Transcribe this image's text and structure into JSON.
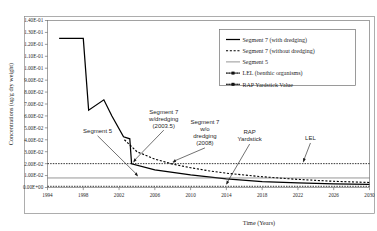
{
  "chart_data": {
    "type": "line",
    "title": "",
    "xlabel": "Time (Years)",
    "ylabel": "Concentrations (ug/g dry weight)",
    "xlim": [
      1994,
      2030
    ],
    "ylim": [
      0.0,
      0.14
    ],
    "xticks": [
      "1994",
      "1998",
      "2002",
      "2006",
      "2010",
      "2014",
      "2018",
      "2022",
      "2026",
      "2030"
    ],
    "yticks": [
      "0.00E+00",
      "1.00E-02",
      "2.00E-02",
      "3.00E-02",
      "4.00E-02",
      "5.00E-02",
      "6.00E-02",
      "7.00E-02",
      "8.00E-02",
      "9.00E-02",
      "1.00E-01",
      "1.10E-01",
      "1.20E-01",
      "1.30E-01",
      "1.40E-01"
    ],
    "grid": false,
    "legend_position": "top-right",
    "series": [
      {
        "name": "Segment 7 (with dredging)",
        "style": "solid",
        "x": [
          1995.3,
          1998.0,
          1998.6,
          2000.3,
          2001.2,
          2002.5,
          2003.2,
          2003.4,
          2006.0,
          2010.0,
          2014.0,
          2018.0,
          2022.0,
          2026.0,
          2030.0
        ],
        "y": [
          0.125,
          0.125,
          0.0648,
          0.0735,
          0.06,
          0.0425,
          0.0408,
          0.0198,
          0.0148,
          0.0105,
          0.0072,
          0.005,
          0.0038,
          0.003,
          0.0026
        ]
      },
      {
        "name": "Segment 7 (without dredging)",
        "style": "dashed",
        "x": [
          2002.6,
          2004.0,
          2006.0,
          2008.0,
          2010.0,
          2012.0,
          2014.0,
          2018.0,
          2022.0,
          2026.0,
          2030.0
        ],
        "y": [
          0.04,
          0.03,
          0.0238,
          0.0196,
          0.0166,
          0.014,
          0.012,
          0.009,
          0.0068,
          0.0052,
          0.0042
        ]
      },
      {
        "name": "Segment 5",
        "style": "thin-solid",
        "x": [
          1994,
          2030
        ],
        "y": [
          0.008,
          0.008
        ]
      },
      {
        "name": "LEL (benthic organisms)",
        "style": "dotted",
        "x": [
          1994,
          2030
        ],
        "y": [
          0.02,
          0.02
        ]
      },
      {
        "name": "RAP Yardstick Value",
        "style": "dotted",
        "x": [
          1994,
          2030
        ],
        "y": [
          0.001,
          0.001
        ]
      }
    ],
    "annotations": [
      {
        "name": "segment-5",
        "lines": [
          "Segment 5"
        ],
        "x": 1999.6,
        "y": 0.0455,
        "arrow_to_x": 2004.1,
        "arrow_to_y": 0.0082
      },
      {
        "name": "segment-7-with-dredging",
        "lines": [
          "Segment 7",
          "w/dredging",
          "(2003.5)"
        ],
        "x": 2007.0,
        "y": 0.062,
        "arrow_to_x": 2003.6,
        "arrow_to_y": 0.02
      },
      {
        "name": "segment-7-without-dredging",
        "lines": [
          "Segment 7",
          "w/o",
          "dredging",
          "(2008)"
        ],
        "x": 2011.6,
        "y": 0.053,
        "arrow_to_x": 2008.0,
        "arrow_to_y": 0.0198
      },
      {
        "name": "rap-yardstick",
        "lines": [
          "RAP",
          "Yardstick"
        ],
        "x": 2016.6,
        "y": 0.0445,
        "arrow_to_x": 2014.0,
        "arrow_to_y": 0.0012
      },
      {
        "name": "lel",
        "lines": [
          "LEL"
        ],
        "x": 2023.4,
        "y": 0.0395,
        "arrow_to_x": 2022.6,
        "arrow_to_y": 0.02
      }
    ]
  }
}
